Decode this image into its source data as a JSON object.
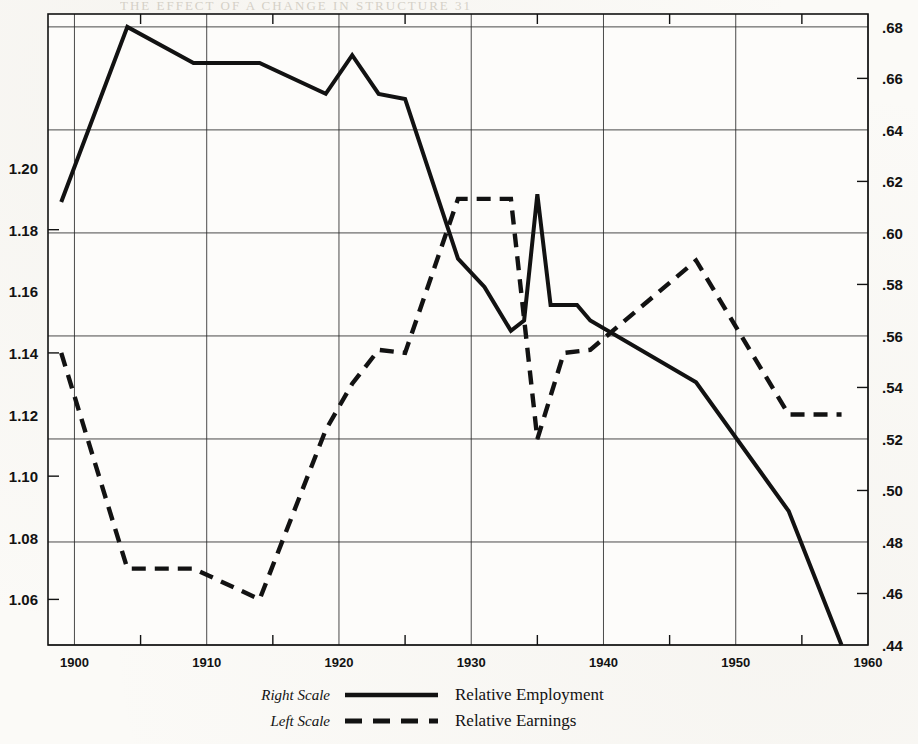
{
  "figure": {
    "background_color": "#fbfaf7",
    "ink_color": "#121212"
  },
  "legend": {
    "position": "below-plot",
    "entries": [
      {
        "scale": "Right Scale",
        "name": "Relative Employment",
        "style": "solid"
      },
      {
        "scale": "Left Scale",
        "name": "Relative Earnings",
        "style": "dashed"
      }
    ]
  },
  "chart_data": {
    "type": "line",
    "title": "",
    "subtitle": "",
    "xlabel": "",
    "ylabel": "",
    "grid": true,
    "legend_position": "below-plot",
    "xlim": [
      1898,
      1960
    ],
    "x_major_ticks": [
      1900,
      1910,
      1920,
      1930,
      1940,
      1950,
      1960
    ],
    "x_minor_ticks": [
      1905,
      1915,
      1925,
      1935,
      1945,
      1955
    ],
    "x_tick_labels": [
      "1900",
      "1910",
      "1920",
      "1930",
      "1940",
      "1950",
      "1960"
    ],
    "axes": [
      {
        "id": "left",
        "name": "Left Scale",
        "series": "Relative Earnings",
        "ylim": [
          1.0452,
          1.25
        ],
        "ticks": [
          1.2,
          1.18,
          1.16,
          1.14,
          1.12,
          1.1,
          1.08,
          1.06
        ],
        "tick_labels": [
          "1.20",
          "1.18",
          "1.16",
          "1.14",
          "1.12",
          "1.10",
          "1.08",
          "1.06"
        ]
      },
      {
        "id": "right",
        "name": "Right Scale",
        "series": "Relative Employment",
        "ylim": [
          0.44,
          0.685
        ],
        "ticks": [
          0.68,
          0.66,
          0.64,
          0.62,
          0.6,
          0.58,
          0.56,
          0.54,
          0.52,
          0.5,
          0.48,
          0.46,
          0.44
        ],
        "tick_labels": [
          ".68",
          ".66",
          ".64",
          ".62",
          ".60",
          ".58",
          ".56",
          ".54",
          ".52",
          ".50",
          ".48",
          ".46",
          ".44"
        ]
      }
    ],
    "gridline_values": {
      "horizontal_major_right_scale": [
        0.68,
        0.64,
        0.6,
        0.56,
        0.52,
        0.48,
        0.44
      ],
      "horizontal_major_left_scale": [
        1.2,
        1.16,
        1.12,
        1.08
      ]
    },
    "series": [
      {
        "name": "Relative Employment",
        "scale": "Right Scale",
        "axis": "right",
        "style": "solid",
        "x": [
          1899,
          1904,
          1909,
          1914,
          1919,
          1921,
          1923,
          1925,
          1929,
          1931,
          1933,
          1934,
          1935,
          1936,
          1938,
          1939,
          1947,
          1954,
          1958
        ],
        "values": [
          0.612,
          0.68,
          0.666,
          0.666,
          0.654,
          0.669,
          0.654,
          0.652,
          0.59,
          0.579,
          0.562,
          0.566,
          0.615,
          0.572,
          0.572,
          0.566,
          0.542,
          0.492,
          0.44
        ]
      },
      {
        "name": "Relative Earnings",
        "scale": "Left Scale",
        "axis": "left",
        "style": "dashed",
        "x": [
          1899,
          1904,
          1909,
          1914,
          1919,
          1921,
          1923,
          1925,
          1929,
          1931,
          1933,
          1935,
          1937,
          1939,
          1947,
          1954,
          1958
        ],
        "values": [
          1.14,
          1.07,
          1.07,
          1.06,
          1.115,
          1.13,
          1.141,
          1.14,
          1.19,
          1.19,
          1.19,
          1.112,
          1.14,
          1.141,
          1.17,
          1.12,
          1.12
        ]
      }
    ]
  }
}
